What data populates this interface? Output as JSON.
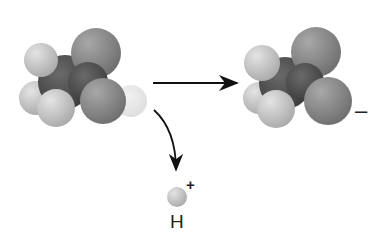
{
  "diagram": {
    "reactant": {
      "name": "neutral-molecule"
    },
    "product": {
      "name": "anion",
      "charge_label": "–"
    },
    "byproduct": {
      "symbol": "H",
      "charge_label": "+"
    },
    "colors": {
      "oxygen": "#8a8a8a",
      "carbon": "#555555",
      "hydrogen": "#d4d4d4",
      "arrow": "#111111"
    }
  }
}
